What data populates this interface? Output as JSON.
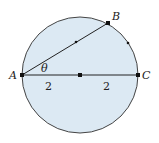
{
  "diagram": {
    "colors": {
      "fill": "#dce9f3",
      "stroke": "#333333",
      "point": "#111111"
    },
    "points": [
      {
        "id": "A",
        "label": "A",
        "x": 22,
        "y": 75
      },
      {
        "id": "B",
        "label": "B",
        "x": 108,
        "y": 23
      },
      {
        "id": "C",
        "label": "C",
        "x": 138,
        "y": 75
      },
      {
        "id": "O",
        "label": "",
        "x": 80,
        "y": 75
      }
    ],
    "angle_label": "θ",
    "segment_labels": [
      "2",
      "2"
    ]
  }
}
